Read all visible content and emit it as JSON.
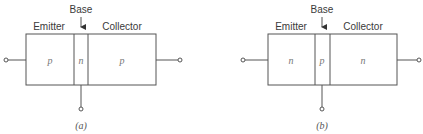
{
  "diagrams": [
    {
      "id": "a",
      "caption": "(a)",
      "base_label": "Base",
      "emitter_label": "Emitter",
      "collector_label": "Collector",
      "regions": {
        "emitter": "p",
        "base": "n",
        "collector": "p"
      },
      "type": "pnp"
    },
    {
      "id": "b",
      "caption": "(b)",
      "base_label": "Base",
      "emitter_label": "Emitter",
      "collector_label": "Collector",
      "regions": {
        "emitter": "n",
        "base": "p",
        "collector": "n"
      },
      "type": "npn"
    }
  ],
  "colors": {
    "line": "#555555",
    "text": "#3a3a3a",
    "background": "#ffffff"
  }
}
